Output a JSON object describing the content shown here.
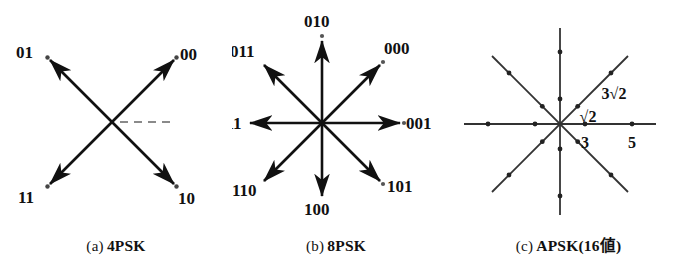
{
  "figure": {
    "background": "#ffffff",
    "ink": "#111111",
    "dash_color": "#7a7a7a",
    "panels": [
      {
        "id": "a",
        "caption_tag": "(a)",
        "caption_name": "4PSK",
        "type": "constellation-phasor",
        "center": {
          "x": 112,
          "y": 122
        },
        "radius": 88,
        "reference_line": {
          "style": "dashed",
          "angle_deg": 0,
          "length": 56
        },
        "points": [
          {
            "label": "00",
            "angle_deg": 45,
            "label_dx": 10,
            "label_dy": -6
          },
          {
            "label": "01",
            "angle_deg": 135,
            "label_dx": -34,
            "label_dy": -6
          },
          {
            "label": "11",
            "angle_deg": 225,
            "label_dx": -32,
            "label_dy": 22
          },
          {
            "label": "10",
            "angle_deg": 315,
            "label_dx": 6,
            "label_dy": 24
          }
        ]
      },
      {
        "id": "b",
        "caption_tag": "(b)",
        "caption_name": "8PSK",
        "type": "constellation-phasor",
        "center": {
          "x": 90,
          "y": 123
        },
        "radius": 86,
        "points": [
          {
            "label": "000",
            "angle_deg": 45,
            "label_dx": 8,
            "label_dy": -10
          },
          {
            "label": "001",
            "angle_deg": 0,
            "label_dx": 10,
            "label_dy": 6
          },
          {
            "label": "010",
            "angle_deg": 90,
            "label_dx": -20,
            "label_dy": -14
          },
          {
            "label": "011",
            "angle_deg": 135,
            "label_dx": -50,
            "label_dy": -8
          },
          {
            "label": "100",
            "angle_deg": 270,
            "label_dx": -20,
            "label_dy": 28
          },
          {
            "label": "101",
            "angle_deg": 315,
            "label_dx": 8,
            "label_dy": 16
          },
          {
            "label": "110",
            "angle_deg": 225,
            "label_dx": -48,
            "label_dy": 18
          },
          {
            "label": "111",
            "angle_deg": 180,
            "label_dx": -48,
            "label_dy": 6
          }
        ]
      },
      {
        "id": "c",
        "caption_tag": "(c)",
        "caption_name": "APSK(16値)",
        "type": "constellation-dots",
        "center": {
          "x": 120,
          "y": 124
        },
        "axis_half_length": 96,
        "ring_radii": [
          25,
          72
        ],
        "ray_angles_deg": [
          0,
          45,
          90,
          135,
          180,
          225,
          270,
          315
        ],
        "point_count": 16,
        "annotations": [
          {
            "text": "3√2",
            "role": "outer-radius-label",
            "x": 158,
            "y": 96
          },
          {
            "text": "√2",
            "role": "inner-radius-label",
            "x": 134,
            "y": 122
          }
        ],
        "axis_ticks": [
          {
            "text": "3",
            "x": 145,
            "y": 148,
            "axis": "x",
            "radius": 25
          },
          {
            "text": "5",
            "x": 180,
            "y": 148,
            "axis": "x",
            "radius": 72
          }
        ]
      }
    ]
  }
}
